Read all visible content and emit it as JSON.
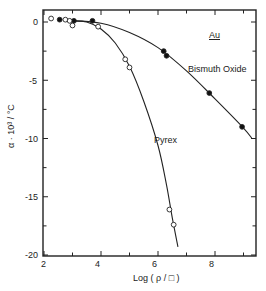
{
  "chart_data": {
    "type": "scatter",
    "title": "",
    "xlabel": "Log (ρ/□)",
    "ylabel": "α · 10³ / °C",
    "xlim": [
      2,
      9.45
    ],
    "ylim": [
      -20,
      1
    ],
    "xticks": [
      2,
      4,
      6,
      8
    ],
    "yticks": [
      0,
      -5,
      -10,
      -15,
      -20
    ],
    "grid": false,
    "annotations": [
      {
        "text": "Au",
        "x": 7.9,
        "y": -1.2,
        "underline": true
      },
      {
        "text": "Bismuth Oxide",
        "x": 7.6,
        "y": -4.2
      },
      {
        "text": "Pyrex",
        "x": 5.6,
        "y": -10.8
      }
    ],
    "series": [
      {
        "name": "Bismuth Oxide",
        "marker": "filled-circle",
        "points": [
          [
            2.55,
            0.2
          ],
          [
            3.05,
            0.1
          ],
          [
            3.7,
            0.1
          ],
          [
            6.2,
            -2.5
          ],
          [
            6.3,
            -2.9
          ],
          [
            7.8,
            -6.1
          ],
          [
            8.95,
            -9.0
          ]
        ],
        "curve": [
          [
            3.0,
            0.1
          ],
          [
            4.0,
            -0.1
          ],
          [
            5.0,
            -0.9
          ],
          [
            6.0,
            -2.2
          ],
          [
            7.0,
            -4.2
          ],
          [
            8.0,
            -6.6
          ],
          [
            9.0,
            -9.1
          ],
          [
            9.3,
            -10.0
          ]
        ]
      },
      {
        "name": "Pyrex",
        "marker": "open-circle",
        "points": [
          [
            2.25,
            0.3
          ],
          [
            2.75,
            0.2
          ],
          [
            2.9,
            0.1
          ],
          [
            3.0,
            -0.3
          ],
          [
            3.9,
            -0.4
          ],
          [
            4.85,
            -3.2
          ],
          [
            5.0,
            -3.9
          ],
          [
            6.4,
            -16.1
          ],
          [
            6.55,
            -17.4
          ]
        ],
        "curve": [
          [
            3.0,
            0.1
          ],
          [
            3.5,
            0.0
          ],
          [
            4.0,
            -0.6
          ],
          [
            4.5,
            -1.8
          ],
          [
            5.0,
            -3.8
          ],
          [
            5.5,
            -6.8
          ],
          [
            6.0,
            -10.6
          ],
          [
            6.3,
            -14.0
          ],
          [
            6.5,
            -16.8
          ],
          [
            6.7,
            -19.3
          ]
        ]
      }
    ]
  },
  "labels": {
    "x_axis_title": "Log  ( ρ / □ )",
    "y_axis_title": "α · 10³ / °C",
    "x_ticks": [
      "2",
      "4",
      "6",
      "8"
    ],
    "y_ticks": [
      "0",
      "-5",
      "-10",
      "-15",
      "-20"
    ],
    "au": "Au",
    "bismuth": "Bismuth Oxide",
    "pyrex": "Pyrex"
  }
}
